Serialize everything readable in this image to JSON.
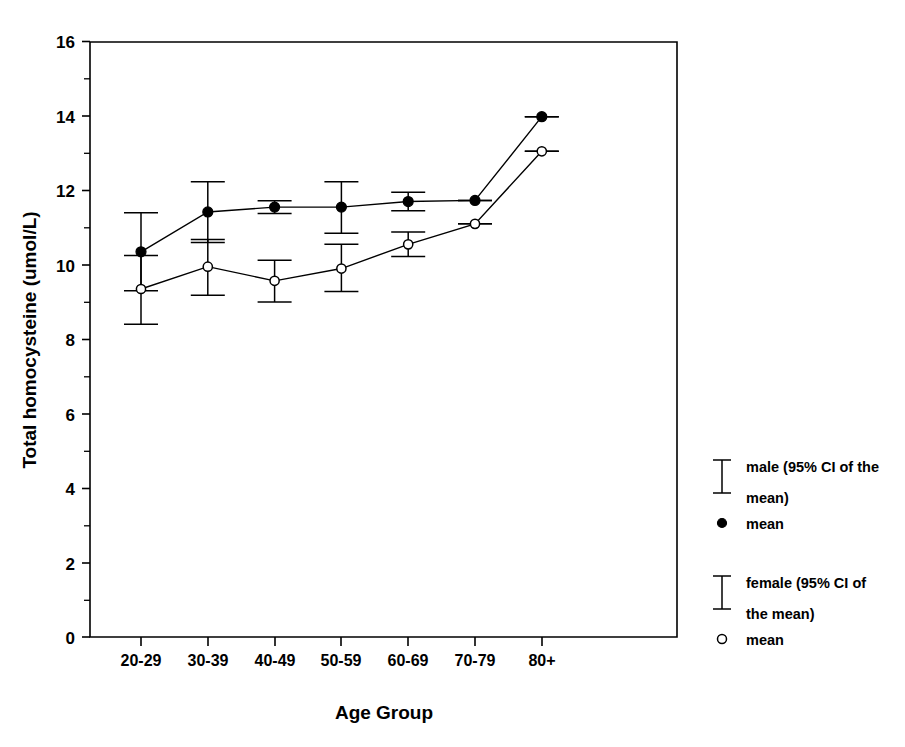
{
  "chart_data": {
    "type": "line",
    "title": "",
    "subtitle": "",
    "xlabel": "Age Group",
    "ylabel": "Total homocysteine (umol/L)",
    "categories": [
      "20-29",
      "30-39",
      "40-49",
      "50-59",
      "60-69",
      "70-79",
      "80+"
    ],
    "ylim": [
      0,
      16
    ],
    "yticks": [
      0,
      2,
      4,
      6,
      8,
      10,
      12,
      14,
      16
    ],
    "ytick_labels": [
      "0",
      "2",
      "4",
      "6",
      "8",
      "10",
      "12",
      "14",
      "16"
    ],
    "minor_ticks": true,
    "grid": false,
    "legend_position": "right",
    "error_bar_type": "95% CI of the mean",
    "series": [
      {
        "name": "male",
        "marker": "filled-circle",
        "values": [
          10.35,
          11.42,
          11.55,
          11.55,
          11.7,
          11.73,
          13.98
        ],
        "ci_lower": [
          9.3,
          10.6,
          11.38,
          10.85,
          11.45,
          11.73,
          13.98
        ],
        "ci_upper": [
          11.4,
          12.23,
          11.72,
          12.23,
          11.95,
          11.73,
          13.98
        ]
      },
      {
        "name": "female",
        "marker": "open-circle",
        "values": [
          9.35,
          9.95,
          9.57,
          9.9,
          10.55,
          11.1,
          13.05
        ],
        "ci_lower": [
          8.4,
          9.18,
          9.0,
          9.28,
          10.22,
          11.1,
          13.05
        ],
        "ci_upper": [
          10.25,
          10.68,
          10.12,
          10.55,
          10.88,
          11.1,
          13.05
        ]
      }
    ],
    "legend": [
      {
        "marker": "error-bar",
        "label": "male (95% CI of the"
      },
      {
        "marker": "none",
        "label": "mean)"
      },
      {
        "marker": "filled-circle",
        "label": "mean"
      },
      {
        "marker": "error-bar",
        "label": "female (95% CI of"
      },
      {
        "marker": "none",
        "label": "the mean)"
      },
      {
        "marker": "open-circle",
        "label": "mean"
      }
    ]
  },
  "colors": {
    "ink": "#000000",
    "background": "#ffffff"
  }
}
